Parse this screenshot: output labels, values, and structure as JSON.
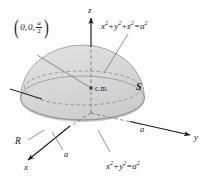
{
  "figure": {
    "background_color": "#fdfdfd",
    "solid_fill": "#d7d7d7",
    "solid_fill_dark": "#c9c9c9",
    "outline_color": "#7a7a7a",
    "axis_color": "#1b1b1b",
    "leader_color": "#6e6e6e"
  },
  "axes": {
    "z_label": "z",
    "y_label": "y",
    "x_label": "x"
  },
  "ticks": {
    "y_tick": "a",
    "x_tick": "a"
  },
  "labels": {
    "surface": "S",
    "region": "R",
    "center_of_mass": "c.m."
  },
  "point": {
    "open_paren": "(",
    "close_paren": ")",
    "x": "0,",
    "y": "0,",
    "frac_num": "a",
    "frac_den": "2"
  },
  "equations": {
    "sphere": {
      "t1": "x",
      "e1": "2",
      "plus1": "+",
      "t2": "y",
      "e2": "2",
      "plus2": "+",
      "t3": "z",
      "e3": "2",
      "eq": "=",
      "t4": "a",
      "e4": "2"
    },
    "circle": {
      "t1": "x",
      "e1": "2",
      "plus1": "+",
      "t2": "y",
      "e2": "2",
      "eq": "=",
      "t3": "a",
      "e3": "2"
    }
  }
}
